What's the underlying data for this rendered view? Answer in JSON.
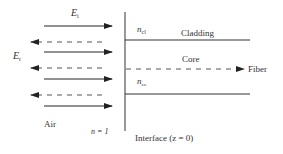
{
  "diagram": {
    "colors": {
      "line": "#333333",
      "dashed": "#555555",
      "background": "#ffffff"
    },
    "labels": {
      "incident_field": "E",
      "incident_sub": "i",
      "reflected_field": "E",
      "reflected_sub": "r",
      "n_cladding": "n",
      "n_cladding_sub": "cl",
      "cladding": "Cladding",
      "core": "Core",
      "fiber": "Fiber",
      "n_core": "n",
      "n_core_sub": "co",
      "air": "Air",
      "air_index": "n = 1",
      "interface": "Interface (z = 0)"
    },
    "incident_arrows": [
      {
        "y": 26
      },
      {
        "y": 52
      },
      {
        "y": 79
      },
      {
        "y": 106
      }
    ],
    "reflected_arrows": [
      {
        "y": 42
      },
      {
        "y": 68
      },
      {
        "y": 95
      }
    ]
  }
}
